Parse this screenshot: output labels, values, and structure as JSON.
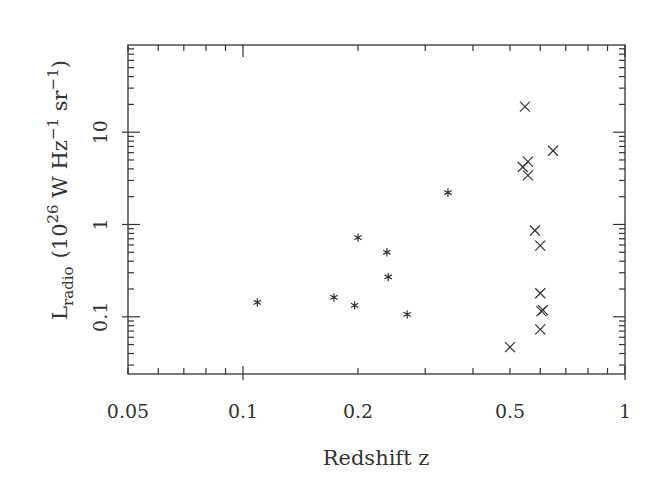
{
  "chart_data": {
    "type": "scatter",
    "title": "",
    "xlabel": "Redshift z",
    "ylabel": {
      "main": "L",
      "sub": "radio",
      "unit_prefix": "(10",
      "unit_exp": "26",
      "unit_mid": " W Hz",
      "unit_exp2": "−1",
      "unit_mid2": " sr",
      "unit_exp3": "−1",
      "unit_suffix": ")"
    },
    "xscale": "log",
    "yscale": "log",
    "xlim": [
      0.05,
      1
    ],
    "ylim": [
      0.024,
      88
    ],
    "grid": false,
    "legend": null,
    "x_ticks": [
      {
        "value": 0.05,
        "label": "0.05"
      },
      {
        "value": 0.1,
        "label": "0.1"
      },
      {
        "value": 0.2,
        "label": "0.2"
      },
      {
        "value": 0.5,
        "label": "0.5"
      },
      {
        "value": 1,
        "label": "1"
      }
    ],
    "y_ticks": [
      {
        "value": 0.1,
        "label": "0.1"
      },
      {
        "value": 1,
        "label": "1"
      },
      {
        "value": 10,
        "label": "10"
      }
    ],
    "series": [
      {
        "name": "asterisk",
        "marker": "asterisk",
        "points": [
          {
            "x": 0.109,
            "y": 0.143
          },
          {
            "x": 0.173,
            "y": 0.162
          },
          {
            "x": 0.196,
            "y": 0.133
          },
          {
            "x": 0.2,
            "y": 0.72
          },
          {
            "x": 0.238,
            "y": 0.5
          },
          {
            "x": 0.24,
            "y": 0.27
          },
          {
            "x": 0.269,
            "y": 0.106
          },
          {
            "x": 0.344,
            "y": 2.22
          }
        ]
      },
      {
        "name": "cross",
        "marker": "x",
        "points": [
          {
            "x": 0.547,
            "y": 18.9
          },
          {
            "x": 0.648,
            "y": 6.3
          },
          {
            "x": 0.557,
            "y": 4.8
          },
          {
            "x": 0.54,
            "y": 4.2
          },
          {
            "x": 0.557,
            "y": 3.4
          },
          {
            "x": 0.581,
            "y": 0.86
          },
          {
            "x": 0.6,
            "y": 0.59
          },
          {
            "x": 0.6,
            "y": 0.18
          },
          {
            "x": 0.604,
            "y": 0.115
          },
          {
            "x": 0.61,
            "y": 0.118
          },
          {
            "x": 0.6,
            "y": 0.073
          },
          {
            "x": 0.5,
            "y": 0.047
          }
        ]
      }
    ]
  },
  "colors": {
    "ink": "#333333",
    "background": "#ffffff"
  }
}
